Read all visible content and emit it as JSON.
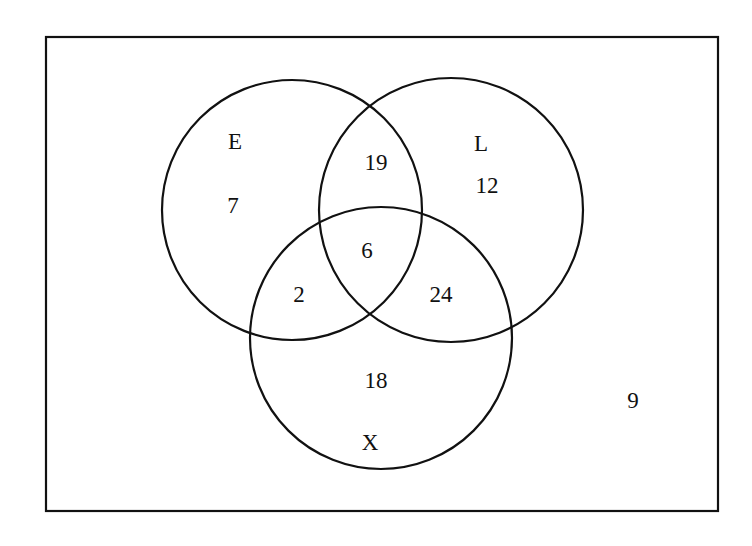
{
  "diagram": {
    "type": "venn",
    "universe": {
      "outside_count": "9"
    },
    "sets": [
      {
        "name": "E",
        "only_count": "7"
      },
      {
        "name": "L",
        "only_count": "12"
      },
      {
        "name": "X",
        "only_count": "18"
      }
    ],
    "intersections": {
      "E_L_only": "19",
      "E_X_only": "2",
      "L_X_only": "24",
      "E_L_X": "6"
    },
    "colors": {
      "stroke": "#111111",
      "background": "#ffffff"
    }
  }
}
